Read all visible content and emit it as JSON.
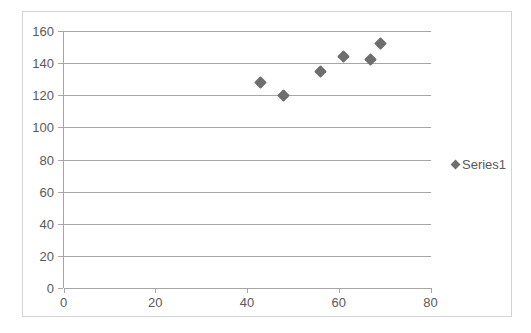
{
  "chart_data": {
    "type": "scatter",
    "title": "",
    "xlabel": "",
    "ylabel": "",
    "xlim": [
      0,
      80
    ],
    "ylim": [
      0,
      160
    ],
    "x_ticks": [
      0,
      20,
      40,
      60,
      80
    ],
    "y_ticks": [
      0,
      20,
      40,
      60,
      80,
      100,
      120,
      140,
      160
    ],
    "x_tick_labels": [
      "0",
      "20",
      "40",
      "60",
      "80"
    ],
    "y_tick_labels": [
      "0",
      "20",
      "40",
      "60",
      "80",
      "100",
      "120",
      "140",
      "160"
    ],
    "grid": "horizontal",
    "legend_position": "right",
    "marker": "diamond",
    "marker_color": "#6e6e6e",
    "series": [
      {
        "name": "Series1",
        "points": [
          {
            "x": 43,
            "y": 128
          },
          {
            "x": 48,
            "y": 120
          },
          {
            "x": 56,
            "y": 135
          },
          {
            "x": 61,
            "y": 144
          },
          {
            "x": 67,
            "y": 142
          },
          {
            "x": 69,
            "y": 152
          }
        ]
      }
    ]
  },
  "legend": {
    "entries": [
      {
        "label": "Series1",
        "color": "#6e6e6e",
        "marker": "diamond-marker-icon"
      }
    ]
  },
  "colors": {
    "gridline": "#a6a6a6",
    "axis": "#a6a6a6",
    "tick_text": "#595959",
    "frame_border": "#d4d4d4",
    "plot_background": "#ffffff",
    "marker": "#6e6e6e"
  }
}
